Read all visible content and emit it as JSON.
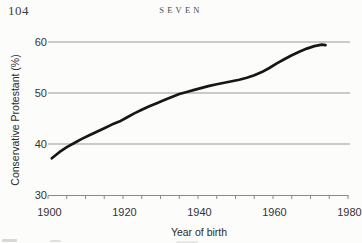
{
  "page": {
    "number": "104",
    "chapter_header": "SEVEN"
  },
  "chart_data": {
    "type": "line",
    "title": "",
    "xlabel": "Year of birth",
    "ylabel": "Conservative Protestant (%)",
    "xlim": [
      1900,
      1980
    ],
    "ylim": [
      30,
      60
    ],
    "x_major_ticks": [
      1900,
      1920,
      1940,
      1960,
      1980
    ],
    "x_minor_tick_step": 5,
    "y_ticks": [
      30,
      40,
      50,
      60
    ],
    "gridlines_y": [
      40,
      50,
      60
    ],
    "grid_on": true,
    "legend": "none",
    "line_color": "#161616",
    "grid_color": "#989898",
    "axis_color": "#8a8a8a",
    "tick_label_color": "#333333",
    "series": [
      {
        "name": "Conservative Protestant percentage by birth cohort",
        "x": [
          1901,
          1903,
          1905,
          1907,
          1909,
          1911,
          1913,
          1915,
          1917,
          1919,
          1921,
          1923,
          1925,
          1927,
          1929,
          1931,
          1933,
          1935,
          1937,
          1939,
          1941,
          1943,
          1945,
          1947,
          1949,
          1951,
          1953,
          1955,
          1957,
          1959,
          1961,
          1963,
          1965,
          1967,
          1969,
          1971,
          1973,
          1974
        ],
        "y": [
          37.2,
          38.4,
          39.4,
          40.2,
          41.0,
          41.7,
          42.4,
          43.1,
          43.8,
          44.4,
          45.2,
          46.0,
          46.7,
          47.4,
          48.0,
          48.6,
          49.2,
          49.8,
          50.2,
          50.6,
          51.0,
          51.4,
          51.7,
          52.0,
          52.3,
          52.6,
          53.0,
          53.5,
          54.1,
          54.9,
          55.8,
          56.6,
          57.4,
          58.1,
          58.7,
          59.2,
          59.5,
          59.4
        ]
      }
    ]
  }
}
